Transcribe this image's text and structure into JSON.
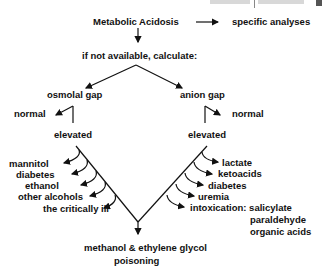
{
  "diagram": {
    "root": "Metabolic Acidosis",
    "root_side": "specific analyses",
    "fallback": "if not available, calculate:",
    "left_branch": {
      "title": "osmolal gap",
      "normal": "normal",
      "elevated": "elevated",
      "causes": [
        "mannitol",
        "diabetes",
        "ethanol",
        "other alcohols",
        "the critically ill"
      ]
    },
    "right_branch": {
      "title": "anion gap",
      "normal": "normal",
      "elevated": "elevated",
      "causes": [
        "lactate",
        "ketoacids",
        "diabetes",
        "uremia",
        "intoxication: salicylate"
      ],
      "intoxication_more": [
        "paraldehyde",
        "organic acids"
      ]
    },
    "conclusion_line1": "methanol & ethylene glycol",
    "conclusion_line2": "poisoning"
  }
}
